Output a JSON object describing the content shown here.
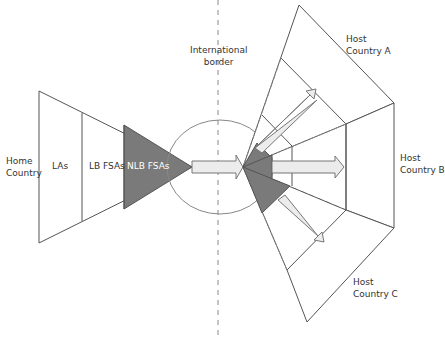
{
  "diagram": {
    "labels": {
      "home_country": "Home\nCountry",
      "las": "LAs",
      "lb_fsas": "LB FSAs",
      "nlb_fsas": "NLB FSAs",
      "international_border": "International\nborder",
      "host_a": "Host\nCountry A",
      "host_b": "Host\nCountry B",
      "host_c": "Host\nCountry C"
    },
    "colors": {
      "line": "#555555",
      "dark_fill": "#7a7a7a",
      "arrow_fill": "#ececec"
    }
  }
}
